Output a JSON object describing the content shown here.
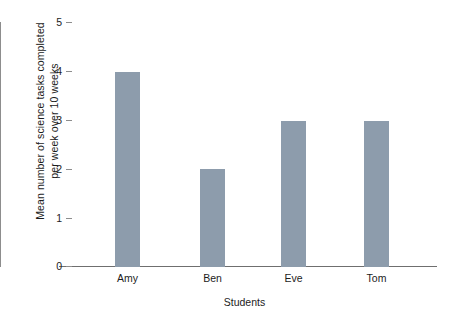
{
  "chart_data": {
    "type": "bar",
    "title": "",
    "subtitle": "",
    "categories": [
      "Amy",
      "Ben",
      "Eve",
      "Tom"
    ],
    "values": [
      4,
      2,
      3,
      3
    ],
    "series": [
      {
        "name": "Mean number of science tasks completed per week over 10 weeks",
        "values": [
          4,
          2,
          3,
          3
        ]
      }
    ],
    "xlabel": "Students",
    "ylabel": "Mean number of science tasks completed per week over 10 weeks",
    "ylabel_line1": "Mean number of science tasks completed",
    "ylabel_line2": "per week over 10 weeks",
    "ylim": [
      0,
      5
    ],
    "ytick_values": [
      0,
      1,
      2,
      3,
      4,
      5
    ],
    "ytick_labels": [
      "0",
      "1",
      "2",
      "3",
      "4",
      "5"
    ],
    "ytick_interval": 1,
    "grid": false,
    "legend": false,
    "legend_position": "none",
    "bar_color": "#8d9cac",
    "axis_color": "#8d8d8d",
    "background_color": "#ffffff",
    "text_color": "#1c1c1c",
    "annotations": []
  }
}
